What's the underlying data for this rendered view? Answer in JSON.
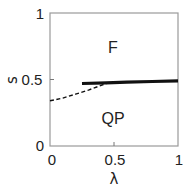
{
  "chart_data": {
    "type": "line",
    "title": "",
    "xlabel": "λ",
    "ylabel": "s",
    "xlim": [
      0,
      1
    ],
    "ylim": [
      0,
      1
    ],
    "xticks": [
      "0",
      "0.5",
      "1"
    ],
    "yticks": [
      "0",
      "0.5",
      "1"
    ],
    "grid": false,
    "legend": null,
    "annotations": [
      {
        "text": "F",
        "x": 0.5,
        "y": 0.75
      },
      {
        "text": "QP",
        "x": 0.5,
        "y": 0.21
      }
    ],
    "series": [
      {
        "name": "solid boundary",
        "style": "solid-thick",
        "color": "#111111",
        "x": [
          0.25,
          0.44,
          0.6,
          0.8,
          1.0
        ],
        "y": [
          0.47,
          0.475,
          0.48,
          0.485,
          0.49
        ]
      },
      {
        "name": "dashed boundary",
        "style": "dashed",
        "color": "#111111",
        "x": [
          0.0,
          0.1,
          0.2,
          0.3,
          0.44
        ],
        "y": [
          0.34,
          0.36,
          0.39,
          0.42,
          0.47
        ]
      }
    ]
  },
  "labels": {
    "xlabel": "λ",
    "ylabel": "s",
    "xticks": [
      "0",
      "0.5",
      "1"
    ],
    "yticks": [
      "0",
      "0.5",
      "1"
    ],
    "region_top": "F",
    "region_bottom": "QP"
  }
}
